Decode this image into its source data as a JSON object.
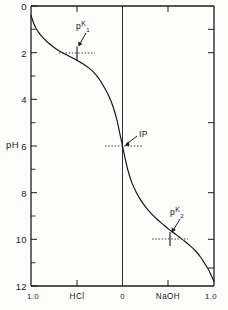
{
  "figure": {
    "name": "amino-acid-titration-curve",
    "background_color": "#fdfdfc",
    "line_color": "#111111"
  },
  "chart_data": {
    "type": "line",
    "title": "",
    "xlabel": "",
    "ylabel": "pH",
    "x_axis": {
      "tick_labels": [
        "1.0",
        "HCl",
        "0",
        "NaOH",
        "1.0"
      ],
      "tick_positions": [
        0.0,
        0.25,
        0.5,
        0.75,
        1.0
      ],
      "category_left": "HCl",
      "category_right": "NaOH",
      "center_label": "0",
      "left_end_label": "1.0",
      "right_end_label": "1.0",
      "range": [
        -1.0,
        1.0
      ],
      "grid": false
    },
    "y_axis": {
      "label": "pH",
      "tick_labels": [
        "0",
        "2",
        "4",
        "6",
        "8",
        "10",
        "12"
      ],
      "tick_values": [
        0,
        2,
        4,
        6,
        8,
        10,
        12
      ],
      "minor_tick_values": [
        1,
        3,
        5,
        7,
        9,
        11
      ],
      "ylim": [
        0,
        12
      ],
      "inverted": true,
      "grid": false
    },
    "legend": {
      "show": false
    },
    "series": [
      {
        "name": "titration curve",
        "x": [
          -1.0,
          -0.97,
          -0.94,
          -0.9,
          -0.86,
          -0.8,
          -0.74,
          -0.68,
          -0.62,
          -0.56,
          -0.5,
          -0.44,
          -0.38,
          -0.32,
          -0.26,
          -0.2,
          -0.15,
          -0.1,
          -0.06,
          -0.03,
          -0.015,
          0.0,
          0.015,
          0.03,
          0.06,
          0.1,
          0.15,
          0.2,
          0.26,
          0.32,
          0.38,
          0.44,
          0.5,
          0.56,
          0.62,
          0.68,
          0.74,
          0.8,
          0.86,
          0.9,
          0.94,
          0.97,
          1.0
        ],
        "y": [
          0.4,
          0.75,
          1.0,
          1.22,
          1.4,
          1.62,
          1.8,
          1.95,
          2.08,
          2.2,
          2.32,
          2.46,
          2.62,
          2.82,
          3.1,
          3.48,
          3.85,
          4.35,
          4.9,
          5.45,
          5.72,
          6.0,
          6.28,
          6.55,
          7.05,
          7.55,
          7.98,
          8.32,
          8.65,
          8.92,
          9.15,
          9.35,
          9.55,
          9.72,
          9.9,
          10.08,
          10.28,
          10.5,
          10.8,
          11.05,
          11.3,
          11.55,
          11.8
        ]
      }
    ],
    "annotations": [
      {
        "id": "pk1",
        "label_base": "p",
        "label_sup": "K",
        "label_sub": "1",
        "text": "pK1",
        "x": -0.5,
        "y": 2.32,
        "marker": "cross",
        "guide": "horizontal-dotted"
      },
      {
        "id": "ip",
        "text": "IP",
        "x": 0.0,
        "y": 6.0,
        "marker": "none",
        "guide": "horizontal-dotted"
      },
      {
        "id": "pk2",
        "label_base": "p",
        "label_sup": "K",
        "label_sub": "2",
        "text": "pK2",
        "x": 0.5,
        "y": 9.55,
        "marker": "cross",
        "guide": "horizontal-dotted"
      }
    ]
  }
}
